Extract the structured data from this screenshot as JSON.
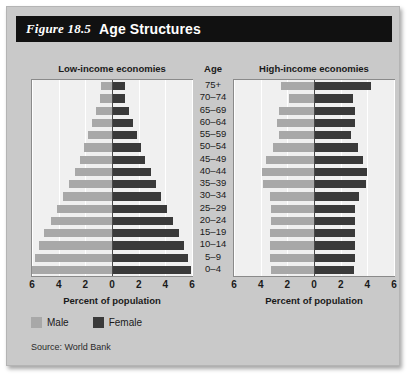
{
  "figure": {
    "number": "Figure 18.5",
    "title": "Age Structures",
    "source": "Source: World Bank"
  },
  "legend": {
    "male_label": "Male",
    "female_label": "Female",
    "male_color": "#a8a8a8",
    "female_color": "#3a3a3a"
  },
  "age_header": "Age",
  "axis_caption": "Percent of population",
  "chart_data": {
    "type": "bar",
    "subtype": "population-pyramid",
    "title": "Age Structures",
    "xlabel": "Percent of population",
    "ylabel": "Age",
    "xlim": [
      -6,
      6
    ],
    "xticks": [
      "6",
      "4",
      "2",
      "0",
      "2",
      "4",
      "6"
    ],
    "xtick_values": [
      -6,
      -4,
      -2,
      0,
      2,
      4,
      6
    ],
    "grid": true,
    "legend_position": "bottom-left",
    "categories": [
      "75+",
      "70–74",
      "65–69",
      "60–64",
      "55–59",
      "50–54",
      "45–49",
      "40–44",
      "35–39",
      "30–34",
      "25–29",
      "20–24",
      "15–19",
      "10–14",
      "5–9",
      "0–4"
    ],
    "panels": [
      {
        "name": "Low-income economies",
        "series": [
          {
            "name": "Male",
            "side": "left",
            "values": [
              0.8,
              0.9,
              1.2,
              1.5,
              1.8,
              2.1,
              2.4,
              2.8,
              3.2,
              3.7,
              4.1,
              4.6,
              5.1,
              5.5,
              5.8,
              6.0
            ]
          },
          {
            "name": "Female",
            "side": "right",
            "values": [
              1.0,
              1.0,
              1.3,
              1.6,
              1.9,
              2.2,
              2.5,
              2.9,
              3.3,
              3.7,
              4.1,
              4.6,
              5.0,
              5.4,
              5.7,
              5.9
            ]
          }
        ]
      },
      {
        "name": "High-income economies",
        "series": [
          {
            "name": "Male",
            "side": "left",
            "values": [
              2.5,
              1.9,
              2.6,
              2.8,
              2.6,
              3.1,
              3.6,
              3.9,
              3.8,
              3.3,
              3.2,
              3.2,
              3.3,
              3.3,
              3.3,
              3.2
            ]
          },
          {
            "name": "Female",
            "side": "right",
            "values": [
              4.3,
              2.9,
              3.1,
              3.1,
              2.8,
              3.3,
              3.7,
              4.0,
              3.9,
              3.4,
              3.1,
              3.1,
              3.1,
              3.1,
              3.1,
              3.0
            ]
          }
        ]
      }
    ]
  }
}
